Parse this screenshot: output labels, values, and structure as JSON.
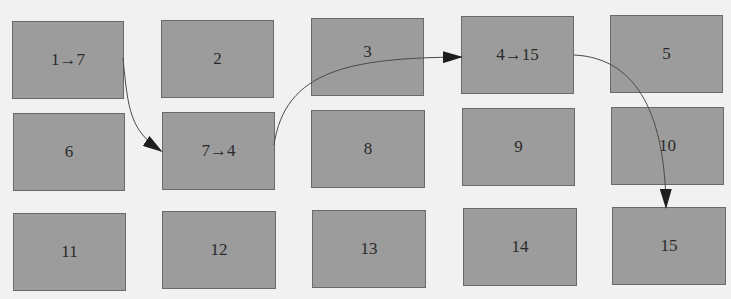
{
  "diagram": {
    "type": "grid-with-arrows",
    "grid": {
      "rows": 3,
      "cols": 5
    },
    "colors": {
      "background": "#f1f1f1",
      "box_fill": "#9c9c9c",
      "box_border": "#6a6a6a",
      "arrow": "#1e1e1e"
    },
    "boxes": [
      {
        "id": 1,
        "label": "1→7"
      },
      {
        "id": 2,
        "label": "2"
      },
      {
        "id": 3,
        "label": "3"
      },
      {
        "id": 4,
        "label": "4→15"
      },
      {
        "id": 5,
        "label": "5"
      },
      {
        "id": 6,
        "label": "6"
      },
      {
        "id": 7,
        "label": "7→4"
      },
      {
        "id": 8,
        "label": "8"
      },
      {
        "id": 9,
        "label": "9"
      },
      {
        "id": 10,
        "label": "10"
      },
      {
        "id": 11,
        "label": "11"
      },
      {
        "id": 12,
        "label": "12"
      },
      {
        "id": 13,
        "label": "13"
      },
      {
        "id": 14,
        "label": "14"
      },
      {
        "id": 15,
        "label": "15"
      }
    ],
    "edges": [
      {
        "from": 1,
        "to": 7
      },
      {
        "from": 7,
        "to": 4
      },
      {
        "from": 4,
        "to": 15
      }
    ]
  }
}
